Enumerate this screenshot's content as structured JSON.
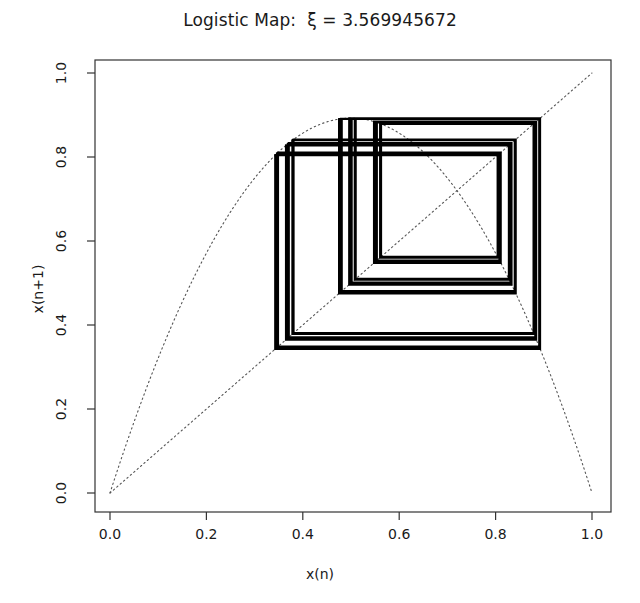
{
  "chart_data": {
    "type": "line",
    "title": "Logistic Map:  ξ = 3.569945672",
    "xlabel": "x(n)",
    "ylabel": "x(n+1)",
    "xlim": [
      -0.04,
      1.04
    ],
    "ylim": [
      -0.04,
      1.04
    ],
    "grid": false,
    "legend": null,
    "parameter": {
      "symbol": "ξ",
      "value": 3.569945672,
      "name": "Feigenbaum accumulation point"
    },
    "xticks": [
      0.0,
      0.2,
      0.4,
      0.6,
      0.8,
      1.0
    ],
    "xtick_labels": [
      "0.0",
      "0.2",
      "0.4",
      "0.6",
      "0.8",
      "1.0"
    ],
    "yticks": [
      0.0,
      0.2,
      0.4,
      0.6,
      0.8,
      1.0
    ],
    "ytick_labels": [
      "0.0",
      "0.2",
      "0.4",
      "0.6",
      "0.8",
      "1.0"
    ],
    "series": [
      {
        "name": "logistic map f(x) = ξ x (1 - x)",
        "style": "dotted",
        "color": "#555555",
        "role": "map-curve",
        "x_range": [
          0.0,
          1.0
        ],
        "apex": [
          0.5,
          0.8925
        ],
        "endpoints": [
          [
            0.0,
            0.0
          ],
          [
            1.0,
            0.0
          ]
        ]
      },
      {
        "name": "identity line y = x",
        "style": "dotted",
        "color": "#555555",
        "role": "diagonal",
        "endpoints": [
          [
            0.0,
            0.0
          ],
          [
            1.0,
            1.0
          ]
        ]
      },
      {
        "name": "cobweb trajectory",
        "style": "solid",
        "color": "#000000",
        "role": "cobweb",
        "x0": 0.35,
        "iterations": 400,
        "burn_in": 260,
        "x_extent": [
          0.3435,
          0.8925
        ],
        "y_extent": [
          0.3435,
          0.8925
        ]
      }
    ]
  },
  "axes_geometry": {
    "frame_left_px": 95,
    "frame_right_px": 611,
    "frame_top_px": 60,
    "frame_bottom_px": 512,
    "x0_px": 110,
    "x1_px": 592,
    "y0_px": 493,
    "y1_px": 73
  }
}
